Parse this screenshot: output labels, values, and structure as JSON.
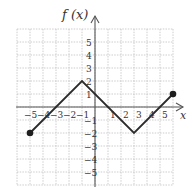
{
  "chart_data": {
    "type": "line",
    "title": "",
    "xlabel": "x",
    "ylabel": "f(x)",
    "xlim": [
      -6,
      6
    ],
    "ylim": [
      -6,
      6
    ],
    "grid": true,
    "grid_style": "dashed",
    "x_ticks": [
      -5,
      -4,
      -3,
      -2,
      -1,
      1,
      2,
      3,
      4,
      5
    ],
    "y_ticks": [
      5,
      4,
      3,
      2,
      1,
      -1,
      -2,
      -3,
      -4,
      -5
    ],
    "x_tick_labels": [
      "−5",
      "−4",
      "−3",
      "−2",
      "−1",
      "1",
      "2",
      "3",
      "4",
      "5"
    ],
    "y_tick_labels": [
      "5",
      "4",
      "3",
      "2",
      "1",
      "−1",
      "−2",
      "−3",
      "−4",
      "−5"
    ],
    "series": [
      {
        "name": "f(x)",
        "points": [
          [
            -5,
            -2
          ],
          [
            -1,
            2
          ],
          [
            3,
            -2
          ],
          [
            6,
            1
          ]
        ],
        "endpoints": [
          [
            -5,
            -2
          ],
          [
            6,
            1
          ]
        ],
        "endpoint_style": "closed"
      }
    ],
    "legend": null
  },
  "labels": {
    "y_axis_title": "f (x)",
    "x_axis_title": "x"
  },
  "colors": {
    "curve": "#2b2b2b",
    "grid": "#b8b8b8",
    "axis": "#555555"
  }
}
